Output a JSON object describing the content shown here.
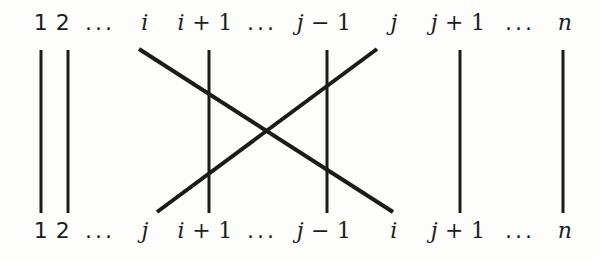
{
  "figure": {
    "background_color": "#fdfdfc",
    "stroke_color": "#1b1b1b",
    "width": 599,
    "height": 261
  },
  "top_row": {
    "labels": [
      {
        "text": "1",
        "kind": "num",
        "x": 41
      },
      {
        "text": "2",
        "kind": "num",
        "x": 63
      },
      {
        "text": "...",
        "kind": "ellipsis",
        "x": 100
      },
      {
        "text": "i",
        "kind": "var",
        "x": 145
      },
      {
        "text": "i + 1",
        "kind": "expr",
        "x": 205
      },
      {
        "text": "...",
        "kind": "ellipsis",
        "x": 262
      },
      {
        "text": "j − 1",
        "kind": "expr",
        "x": 324
      },
      {
        "text": "j",
        "kind": "var",
        "x": 394
      },
      {
        "text": "j + 1",
        "kind": "expr",
        "x": 458
      },
      {
        "text": "...",
        "kind": "ellipsis",
        "x": 520
      },
      {
        "text": "n",
        "kind": "var",
        "x": 565
      }
    ]
  },
  "bottom_row": {
    "labels": [
      {
        "text": "1",
        "kind": "num",
        "x": 41
      },
      {
        "text": "2",
        "kind": "num",
        "x": 63
      },
      {
        "text": "...",
        "kind": "ellipsis",
        "x": 100
      },
      {
        "text": "j",
        "kind": "var",
        "x": 145
      },
      {
        "text": "i + 1",
        "kind": "expr",
        "x": 205
      },
      {
        "text": "...",
        "kind": "ellipsis",
        "x": 262
      },
      {
        "text": "j − 1",
        "kind": "expr",
        "x": 324
      },
      {
        "text": "i",
        "kind": "var",
        "x": 394
      },
      {
        "text": "j + 1",
        "kind": "expr",
        "x": 458
      },
      {
        "text": "...",
        "kind": "ellipsis",
        "x": 520
      },
      {
        "text": "n",
        "kind": "var",
        "x": 565
      }
    ]
  },
  "wires": {
    "stroke_width_vertical": 3,
    "stroke_width_diagonal": 4,
    "top_y": 50,
    "bottom_y": 213,
    "vertical_lines": [
      {
        "name": "wire-1",
        "x": 41
      },
      {
        "name": "wire-2",
        "x": 68
      },
      {
        "name": "wire-i-plus-1",
        "x": 209
      },
      {
        "name": "wire-j-minus-1",
        "x": 327
      },
      {
        "name": "wire-j-plus-1",
        "x": 460
      },
      {
        "name": "wire-n",
        "x": 563
      }
    ],
    "diagonal_lines": [
      {
        "name": "wire-i-to-j",
        "x1": 139,
        "y1": 49,
        "x2": 393,
        "y2": 212
      },
      {
        "name": "wire-j-to-i",
        "x1": 377,
        "y1": 49,
        "x2": 157,
        "y2": 212
      }
    ]
  }
}
